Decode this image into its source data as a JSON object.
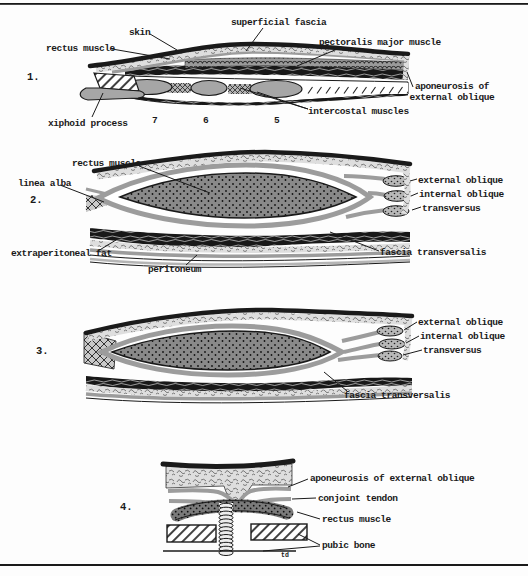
{
  "labels": {
    "s1": {
      "number": "1.",
      "superficial_fascia": "superficial fascia",
      "skin": "skin",
      "rectus_muscle": "rectus muscle",
      "pectoralis_major": "pectoralis major muscle",
      "aponeurosis": "aponeurosis of\nexternal oblique",
      "xiphoid": "xiphoid process",
      "intercostal": "intercostal muscles",
      "cartilage_7": "7",
      "cartilage_6": "6",
      "cartilage_5": "5"
    },
    "s2": {
      "number": "2.",
      "rectus_muscle": "rectus muscle",
      "linea_alba": "linea alba",
      "external_oblique": "external oblique",
      "internal_oblique": "internal oblique",
      "transversus": "transversus",
      "extraperitoneal_fat": "extraperitoneal fat",
      "peritoneum": "peritoneum",
      "fascia_transversalis": "fascia transversalis"
    },
    "s3": {
      "number": "3.",
      "external_oblique": "external oblique",
      "internal_oblique": "internal oblique",
      "transversus": "transversus",
      "fascia_transversalis": "fascia transversalis"
    },
    "s4": {
      "number": "4.",
      "aponeurosis": "aponeurosis of external oblique",
      "conjoint_tendon": "conjoint tendon",
      "rectus_muscle": "rectus muscle",
      "pubic_bone": "pubic bone",
      "footnote": "td"
    }
  },
  "colors": {
    "ink": "#1a1a1a",
    "muscle_gray": "#9c9c9c",
    "rectus_gray": "#898989",
    "fascia_light": "#dedede",
    "paper": "#fdfdfd"
  }
}
